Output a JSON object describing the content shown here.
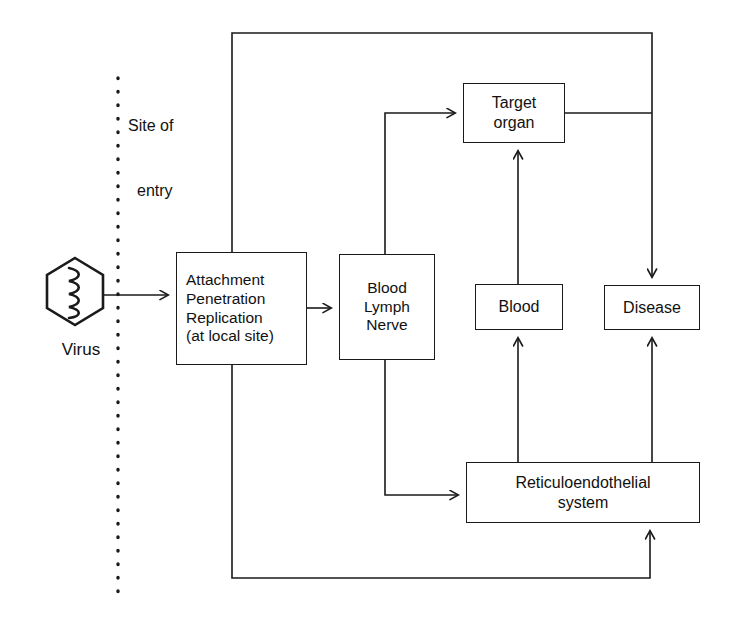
{
  "diagram": {
    "stroke_color": "#1a1a1a",
    "background_color": "#ffffff",
    "icons": {
      "virus": "virus-hexagon-icon",
      "site_of_entry_divider": "dotted-vertical-divider-icon"
    },
    "virus": {
      "label": "Virus"
    },
    "site_of_entry": {
      "line1": "Site of",
      "line2": "entry"
    },
    "nodes": {
      "attachment": {
        "line1": "Attachment",
        "line2": "Penetration",
        "line3": "Replication",
        "line4": "(at local site)"
      },
      "blood_lymph_nerve": {
        "line1": "Blood",
        "line2": "Lymph",
        "line3": "Nerve"
      },
      "target_organ": {
        "line1": "Target",
        "line2": "organ"
      },
      "blood": {
        "line1": "Blood"
      },
      "disease": {
        "line1": "Disease"
      },
      "reticuloendothelial": {
        "line1": "Reticuloendothelial",
        "line2": "system"
      }
    },
    "edges": [
      {
        "name": "virus-to-attachment",
        "from": "Virus",
        "to": "Attachment Penetration Replication",
        "arrow": true
      },
      {
        "name": "attachment-to-blood-lymph-nerve",
        "from": "Attachment Penetration Replication",
        "to": "Blood Lymph Nerve",
        "arrow": true
      },
      {
        "name": "blood-lymph-nerve-to-target-organ",
        "from": "Blood Lymph Nerve",
        "to": "Target organ",
        "arrow": true
      },
      {
        "name": "blood-lymph-nerve-to-reticuloendothelial",
        "from": "Blood Lymph Nerve",
        "to": "Reticuloendothelial system",
        "arrow": true
      },
      {
        "name": "blood-to-target-organ",
        "from": "Blood",
        "to": "Target organ",
        "arrow": true
      },
      {
        "name": "reticuloendothelial-to-blood",
        "from": "Reticuloendothelial system",
        "to": "Blood",
        "arrow": true
      },
      {
        "name": "reticuloendothelial-to-disease",
        "from": "Reticuloendothelial system",
        "to": "Disease",
        "arrow": true
      },
      {
        "name": "target-organ-to-disease",
        "from": "Target organ",
        "to": "Disease",
        "arrow": true
      },
      {
        "name": "attachment-top-rail-to-disease",
        "from": "Attachment Penetration Replication",
        "to": "Disease",
        "arrow": true
      },
      {
        "name": "attachment-bottom-rail-to-reticuloendothelial",
        "from": "Attachment Penetration Replication",
        "to": "Reticuloendothelial system",
        "arrow": true
      }
    ]
  }
}
